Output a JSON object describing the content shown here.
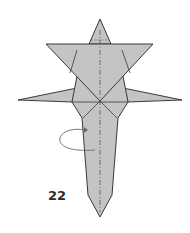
{
  "diagram": {
    "type": "origami-instruction",
    "step_number": "22",
    "instruction": "turn over / fold behind along vertical valley-mountain line",
    "colors": {
      "paper": "#c4c4c4",
      "edge": "#3a3a3a",
      "crease": "#555555",
      "arrow": "#6a6a6a",
      "label": "#2b2b2b",
      "background": "#ffffff"
    },
    "symbols": [
      {
        "name": "mountain-fold-line",
        "style": "dash-dot",
        "orientation": "vertical-center"
      },
      {
        "name": "rotate-arrow",
        "style": "curved loop",
        "side": "left"
      }
    ]
  }
}
